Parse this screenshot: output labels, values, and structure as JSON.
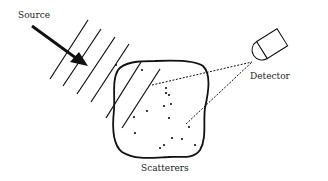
{
  "diagram": {
    "labels": {
      "source": "Source",
      "detector": "Detector",
      "scatterers": "Scatterers"
    },
    "colors": {
      "ink": "#111111",
      "background": "#ffffff"
    },
    "wavefronts": [
      {
        "x1": 50,
        "y1": 79,
        "x2": 88,
        "y2": 20
      },
      {
        "x1": 63,
        "y1": 86,
        "x2": 101,
        "y2": 29
      },
      {
        "x1": 77,
        "y1": 94,
        "x2": 115,
        "y2": 37
      },
      {
        "x1": 91,
        "y1": 102,
        "x2": 129,
        "y2": 44
      },
      {
        "x1": 106,
        "y1": 118,
        "x2": 141,
        "y2": 62
      },
      {
        "x1": 122,
        "y1": 128,
        "x2": 160,
        "y2": 69
      }
    ],
    "scatterer_dots": [
      [
        142,
        70
      ],
      [
        166,
        88
      ],
      [
        166,
        93
      ],
      [
        169,
        95
      ],
      [
        147,
        111
      ],
      [
        164,
        106
      ],
      [
        171,
        104
      ],
      [
        134,
        117
      ],
      [
        169,
        118
      ],
      [
        189,
        127
      ],
      [
        135,
        133
      ],
      [
        172,
        138
      ],
      [
        182,
        139
      ],
      [
        164,
        145
      ],
      [
        160,
        148
      ],
      [
        195,
        145
      ],
      [
        116,
        65
      ]
    ],
    "detector": {
      "face_center": [
        262,
        60
      ],
      "angle_deg": -30
    }
  }
}
